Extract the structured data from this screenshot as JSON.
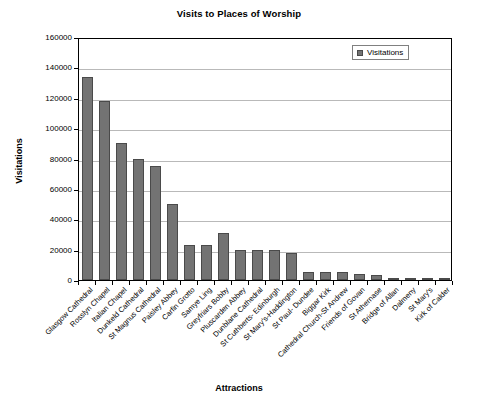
{
  "chart_data": {
    "type": "bar",
    "title": "Visits to Places of Worship",
    "xlabel": "Attractions",
    "ylabel": "Visitations",
    "ylim": [
      0,
      160000
    ],
    "ytick_labels": [
      "160000",
      "140000",
      "120000",
      "100000",
      "80000",
      "60000",
      "40000",
      "20000",
      "0"
    ],
    "ytick_values": [
      160000,
      140000,
      120000,
      100000,
      80000,
      60000,
      40000,
      20000,
      0
    ],
    "grid": true,
    "legend_position": "top-right",
    "legend": [
      "Visitations"
    ],
    "categories": [
      "Glasgow Cathedral",
      "Rosslyn Chapel",
      "Italian Chapel",
      "Dunkeld Cathedral",
      "St Magnus Cathedral",
      "Paisley Abbey",
      "Carfin Grotto",
      "Samye Ling",
      "Greyfriars Bobby",
      "Pluscarden Abbey",
      "Dunblane Cathedral",
      "St Cuthberts- Edinburgh",
      "St Mary's-Haddington",
      "St Paul- Dundee",
      "Biggar Kirk",
      "Cathedral Church-St Andrew",
      "Friends of Govan",
      "St Athernase",
      "Bridge of Allan",
      "Dalmeny",
      "St Mary's",
      "Kirk of Calder"
    ],
    "series": [
      {
        "name": "Visitations",
        "values": [
          134000,
          118000,
          90000,
          80000,
          75000,
          50000,
          23000,
          23000,
          31000,
          20000,
          20000,
          20000,
          18000,
          5500,
          5500,
          5500,
          4000,
          3500,
          1200,
          800,
          700,
          500
        ]
      }
    ]
  },
  "legend": {
    "swatch_name": "visitations-swatch"
  }
}
